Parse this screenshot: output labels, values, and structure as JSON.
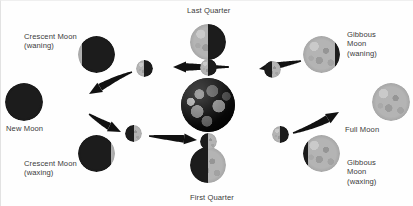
{
  "diagram": {
    "center_body": "earth",
    "colors": {
      "lit": "#b4b4b4",
      "dark": "#1c1c1c",
      "arrow": "#111111",
      "text": "#3b3b3b",
      "background": "#fefefe"
    },
    "labels": [
      {
        "name": "last-quarter",
        "text": "Last Quarter",
        "x": 186,
        "y": 5,
        "align": "left"
      },
      {
        "name": "gibbous-waning",
        "text": "Gibbous\nMoon\n(waning)",
        "x": 346,
        "y": 29,
        "align": "left"
      },
      {
        "name": "crescent-waning",
        "text": "Crescent Moon\n(waning)",
        "x": 23,
        "y": 31,
        "align": "left"
      },
      {
        "name": "new-moon",
        "text": "New Moon",
        "x": 5,
        "y": 123,
        "align": "left"
      },
      {
        "name": "full-moon",
        "text": "Full Moon",
        "x": 344,
        "y": 124,
        "align": "left"
      },
      {
        "name": "crescent-waxing",
        "text": "Crescent Moon\n(waxing)",
        "x": 23,
        "y": 158,
        "align": "left"
      },
      {
        "name": "gibbous-waxing",
        "text": "Gibbous\nMoon\n(waxing)",
        "x": 346,
        "y": 157,
        "align": "left"
      },
      {
        "name": "first-quarter",
        "text": "First Quarter",
        "x": 189,
        "y": 192,
        "align": "left"
      }
    ],
    "outer_moons": [
      {
        "name": "outer-moon-crescent-waning",
        "phase": "waning crescent",
        "cx": 95,
        "cy": 53,
        "r": 18.5,
        "lit_fraction": 0.12,
        "lit_side": "left"
      },
      {
        "name": "outer-moon-last-quarter",
        "phase": "last quarter",
        "cx": 207,
        "cy": 41,
        "r": 18.0,
        "lit_fraction": 0.5,
        "lit_side": "left"
      },
      {
        "name": "outer-moon-gibbous-waning",
        "phase": "waning gibbous",
        "cx": 320,
        "cy": 53,
        "r": 18.5,
        "lit_fraction": 0.86,
        "lit_side": "left"
      },
      {
        "name": "outer-moon-new",
        "phase": "new moon",
        "cx": 23,
        "cy": 101,
        "r": 19.0,
        "lit_fraction": 0.02,
        "lit_side": "left"
      },
      {
        "name": "outer-moon-full",
        "phase": "full moon",
        "cx": 390,
        "cy": 101,
        "r": 19.0,
        "lit_fraction": 1.0,
        "lit_side": "left"
      },
      {
        "name": "outer-moon-crescent-waxing",
        "phase": "waxing crescent",
        "cx": 95,
        "cy": 152,
        "r": 18.5,
        "lit_fraction": 0.12,
        "lit_side": "right"
      },
      {
        "name": "outer-moon-first-quarter",
        "phase": "first quarter",
        "cx": 207,
        "cy": 164,
        "r": 18.0,
        "lit_fraction": 0.5,
        "lit_side": "right"
      },
      {
        "name": "outer-moon-gibbous-waxing",
        "phase": "waxing gibbous",
        "cx": 320,
        "cy": 152,
        "r": 18.5,
        "lit_fraction": 0.86,
        "lit_side": "right"
      }
    ],
    "orbit_moons": [
      {
        "name": "orbit-moon-upper-left",
        "phase": "waning crescent",
        "cx": 143,
        "cy": 67,
        "r": 8.5,
        "lit_fraction": 0.45,
        "lit_side": "left"
      },
      {
        "name": "orbit-moon-top",
        "phase": "last quarter",
        "cx": 207,
        "cy": 66,
        "r": 8.5,
        "lit_fraction": 0.5,
        "lit_side": "left"
      },
      {
        "name": "orbit-moon-upper-right",
        "phase": "waning gibbous",
        "cx": 271,
        "cy": 68,
        "r": 8.5,
        "lit_fraction": 0.55,
        "lit_side": "right"
      },
      {
        "name": "orbit-moon-lower-left",
        "phase": "waxing crescent",
        "cx": 132,
        "cy": 132,
        "r": 8.5,
        "lit_fraction": 0.5,
        "lit_side": "right"
      },
      {
        "name": "orbit-moon-bottom",
        "phase": "first quarter",
        "cx": 207,
        "cy": 140,
        "r": 8.5,
        "lit_fraction": 0.5,
        "lit_side": "right"
      },
      {
        "name": "orbit-moon-lower-right",
        "phase": "waxing gibbous",
        "cx": 279,
        "cy": 133,
        "r": 8.5,
        "lit_fraction": 0.5,
        "lit_side": "left"
      }
    ],
    "earth": {
      "name": "earth",
      "cx": 207,
      "cy": 104,
      "r": 27
    },
    "arrows": [
      {
        "name": "arrow-top-right-inbound",
        "path": "M 300 60 L 258 68",
        "direction": "left"
      },
      {
        "name": "arrow-top-center-left",
        "path": "M 228 66 L 172 66",
        "direction": "left"
      },
      {
        "name": "arrow-top-left-outbound",
        "path": "M 131 71 Q 112 78 88 93",
        "direction": "left"
      },
      {
        "name": "arrow-bottom-left-out",
        "path": "M 88 113 Q 104 124 120 131",
        "direction": "right"
      },
      {
        "name": "arrow-bottom-center",
        "path": "M 148 135 L 196 139",
        "direction": "right"
      },
      {
        "name": "arrow-bottom-right-out",
        "path": "M 292 132 Q 318 124 338 111",
        "direction": "right"
      }
    ]
  }
}
